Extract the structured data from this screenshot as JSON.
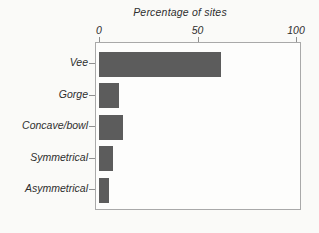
{
  "chart": {
    "title": "Percentage of sites",
    "colors": {
      "bar": "#5c5c5c",
      "frame": "#a9a9a9",
      "tick": "#8f8f8f",
      "text": "#2e2e2e",
      "background": "#fafaf8",
      "plot_background": "#fdfdfc"
    }
  },
  "chart_data": {
    "type": "bar",
    "orientation": "horizontal",
    "title": "Percentage of sites",
    "xlabel": "Percentage of sites",
    "ylabel": "",
    "categories": [
      "Vee",
      "Gorge",
      "Concave/bowl",
      "Symmetrical",
      "Asymmetrical"
    ],
    "values": [
      62,
      10,
      12,
      7,
      5
    ],
    "xlim": [
      0,
      100
    ],
    "x_tick_values": [
      0,
      50,
      100
    ],
    "x_tick_labels": [
      "0",
      "50",
      "100"
    ],
    "grid": false,
    "legend": false
  }
}
